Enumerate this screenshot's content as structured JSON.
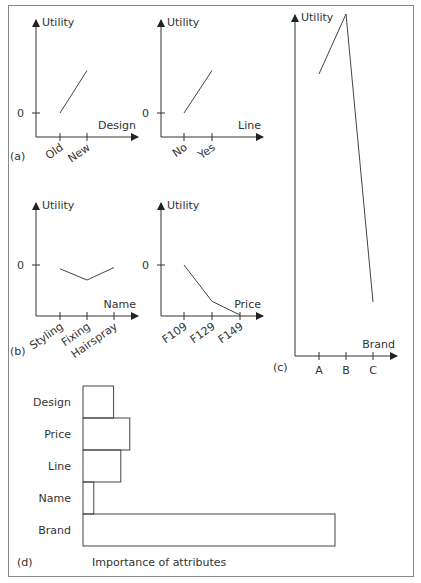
{
  "chart_data": [
    {
      "id": "a1",
      "type": "line",
      "panel_label": "(a)",
      "ylabel": "Utility",
      "xlabel": "Design",
      "categories": [
        "Old",
        "New"
      ],
      "values": [
        0,
        1.7
      ],
      "zero_label": "0"
    },
    {
      "id": "a2",
      "type": "line",
      "panel_label": "",
      "ylabel": "Utility",
      "xlabel": "Line",
      "categories": [
        "No",
        "Yes"
      ],
      "values": [
        0,
        1.7
      ],
      "zero_label": "0"
    },
    {
      "id": "b1",
      "type": "line",
      "panel_label": "(b)",
      "ylabel": "Utility",
      "xlabel": "Name",
      "categories": [
        "Styling",
        "Fixing",
        "Hairspray"
      ],
      "values": [
        -0.15,
        -0.6,
        -0.1
      ],
      "zero_label": "0"
    },
    {
      "id": "b2",
      "type": "line",
      "panel_label": "",
      "ylabel": "Utility",
      "xlabel": "Price",
      "categories": [
        "F109",
        "F129",
        "F149"
      ],
      "values": [
        0,
        -1.45,
        -2.0
      ],
      "zero_label": "0"
    },
    {
      "id": "c",
      "type": "line",
      "panel_label": "(c)",
      "ylabel": "Utility",
      "xlabel": "Brand",
      "categories": [
        "A",
        "B",
        "C"
      ],
      "values": [
        1.0,
        3.0,
        -6.6
      ]
    },
    {
      "id": "d",
      "type": "bar",
      "orientation": "horizontal",
      "panel_label": "(d)",
      "title": "Importance of attributes",
      "categories": [
        "Design",
        "Price",
        "Line",
        "Name",
        "Brand"
      ],
      "values": [
        1.7,
        2.6,
        2.1,
        0.6,
        14.0
      ]
    }
  ]
}
